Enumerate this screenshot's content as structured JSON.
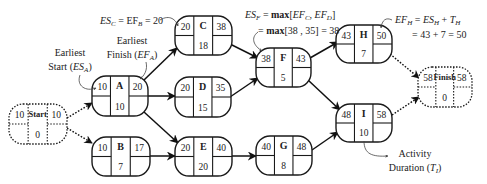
{
  "diagram": {
    "type": "activity-on-node-network-forward-pass",
    "nodes": [
      {
        "id": "Start",
        "es": "10",
        "ef": "10",
        "duration": "0",
        "style": "dotted"
      },
      {
        "id": "A",
        "es": "10",
        "ef": "20",
        "duration": "10",
        "style": "solid"
      },
      {
        "id": "B",
        "es": "10",
        "ef": "17",
        "duration": "7",
        "style": "solid"
      },
      {
        "id": "C",
        "es": "20",
        "ef": "38",
        "duration": "18",
        "style": "solid"
      },
      {
        "id": "D",
        "es": "20",
        "ef": "35",
        "duration": "15",
        "style": "solid"
      },
      {
        "id": "E",
        "es": "20",
        "ef": "40",
        "duration": "20",
        "style": "solid"
      },
      {
        "id": "F",
        "es": "38",
        "ef": "43",
        "duration": "5",
        "style": "solid"
      },
      {
        "id": "G",
        "es": "40",
        "ef": "48",
        "duration": "8",
        "style": "solid"
      },
      {
        "id": "H",
        "es": "43",
        "ef": "50",
        "duration": "7",
        "style": "solid"
      },
      {
        "id": "I",
        "es": "48",
        "ef": "58",
        "duration": "10",
        "style": "solid"
      },
      {
        "id": "Finish",
        "es": "58",
        "ef": "58",
        "duration": "0",
        "style": "dotted"
      }
    ],
    "edges": [
      {
        "from": "Start",
        "to": "A",
        "style": "dotted"
      },
      {
        "from": "Start",
        "to": "B",
        "style": "dotted"
      },
      {
        "from": "A",
        "to": "C",
        "style": "solid"
      },
      {
        "from": "A",
        "to": "D",
        "style": "solid"
      },
      {
        "from": "A",
        "to": "E",
        "style": "solid"
      },
      {
        "from": "B",
        "to": "E",
        "style": "solid"
      },
      {
        "from": "C",
        "to": "F",
        "style": "solid"
      },
      {
        "from": "D",
        "to": "F",
        "style": "solid"
      },
      {
        "from": "E",
        "to": "G",
        "style": "solid"
      },
      {
        "from": "F",
        "to": "H",
        "style": "solid"
      },
      {
        "from": "F",
        "to": "I",
        "style": "solid"
      },
      {
        "from": "G",
        "to": "I",
        "style": "solid"
      },
      {
        "from": "H",
        "to": "Finish",
        "style": "dotted"
      },
      {
        "from": "I",
        "to": "Finish",
        "style": "dotted"
      }
    ],
    "annotations": {
      "es_c": {
        "lhs": "ES",
        "lhs_sub": "C",
        "mid": " = EF",
        "mid_sub": "B",
        "rhs": " = 20"
      },
      "earliest_finish": {
        "line1": "Earliest",
        "line2_pre": "Finish (",
        "var": "EF",
        "sub": "A",
        "line2_post": ")"
      },
      "earliest_start": {
        "line1": "Earliest",
        "line2_pre": "Start (",
        "var": "ES",
        "sub": "A",
        "line2_post": ")"
      },
      "es_f_line1": {
        "lhs": "ES",
        "lhs_sub": "F",
        "eq": " = ",
        "fn": "max",
        "args_pre": "[",
        "a": "EF",
        "a_sub": "C",
        "sep": ", ",
        "b": "EF",
        "b_sub": "D",
        "args_post": "]"
      },
      "es_f_line2": {
        "eq": "= ",
        "fn": "max",
        "rest": "[38 , 35] = 38"
      },
      "ef_h_line1": {
        "lhs": "EF",
        "lhs_sub": "H",
        "eq": " = ",
        "a": "ES",
        "a_sub": "H",
        "plus": " + ",
        "b": "T",
        "b_sub": "H"
      },
      "ef_h_line2": {
        "text": "= 43 + 7 = 50"
      },
      "activity_duration": {
        "line1": "Activity",
        "line2_pre": "Duration (",
        "var": "T",
        "sub": "I",
        "line2_post": ")"
      }
    }
  }
}
